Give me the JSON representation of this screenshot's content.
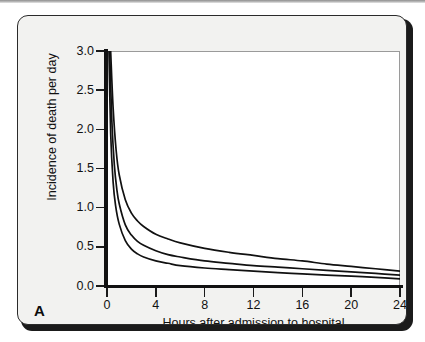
{
  "figure": {
    "panel_label": "A",
    "background_color": "#f2f2f0",
    "border_color": "#2a2a2a"
  },
  "chart_data": {
    "type": "line",
    "title": "",
    "subtitle": "",
    "xlabel": "Hours after admission to hospital",
    "ylabel": "Incidence of death per day",
    "xlim": [
      0,
      24
    ],
    "ylim": [
      0.0,
      3.0
    ],
    "xticks": [
      0,
      4,
      8,
      12,
      16,
      20,
      24
    ],
    "xticklabels": [
      "0",
      "4",
      "8",
      "12",
      "16",
      "20",
      "24"
    ],
    "yticks": [
      0.0,
      0.5,
      1.0,
      1.5,
      2.0,
      2.5,
      3.0
    ],
    "yticklabels": [
      "0.0",
      "0.5",
      "1.0",
      "1.5",
      "2.0",
      "2.5",
      "3.0"
    ],
    "grid": false,
    "legend": false,
    "legend_position": "none",
    "line_color": "#111111",
    "series": [
      {
        "name": "curve-upper",
        "x": [
          0.3,
          0.5,
          0.75,
          1.0,
          1.5,
          2.0,
          2.5,
          3.0,
          4.0,
          5.0,
          6.0,
          8.0,
          10.0,
          12.0,
          14.0,
          16.0,
          18.0,
          20.0,
          22.0,
          24.0
        ],
        "values": [
          3.0,
          2.28,
          1.73,
          1.42,
          1.1,
          0.93,
          0.83,
          0.76,
          0.66,
          0.6,
          0.55,
          0.48,
          0.43,
          0.39,
          0.35,
          0.32,
          0.28,
          0.25,
          0.22,
          0.19
        ]
      },
      {
        "name": "curve-middle",
        "x": [
          0.22,
          0.4,
          0.6,
          0.8,
          1.0,
          1.5,
          2.0,
          2.5,
          3.0,
          4.0,
          5.0,
          6.0,
          8.0,
          10.0,
          12.0,
          14.0,
          16.0,
          18.0,
          20.0,
          22.0,
          24.0
        ],
        "values": [
          3.0,
          2.1,
          1.55,
          1.24,
          1.05,
          0.78,
          0.65,
          0.57,
          0.52,
          0.45,
          0.4,
          0.37,
          0.32,
          0.29,
          0.26,
          0.24,
          0.22,
          0.2,
          0.18,
          0.16,
          0.14
        ]
      },
      {
        "name": "curve-lower",
        "x": [
          0.16,
          0.3,
          0.5,
          0.7,
          1.0,
          1.5,
          2.0,
          2.5,
          3.0,
          4.0,
          5.0,
          6.0,
          8.0,
          10.0,
          12.0,
          14.0,
          16.0,
          18.0,
          20.0,
          22.0,
          24.0
        ],
        "values": [
          3.0,
          1.95,
          1.33,
          1.03,
          0.79,
          0.58,
          0.47,
          0.41,
          0.37,
          0.32,
          0.29,
          0.26,
          0.23,
          0.21,
          0.19,
          0.17,
          0.155,
          0.14,
          0.125,
          0.11,
          0.09
        ]
      }
    ]
  }
}
